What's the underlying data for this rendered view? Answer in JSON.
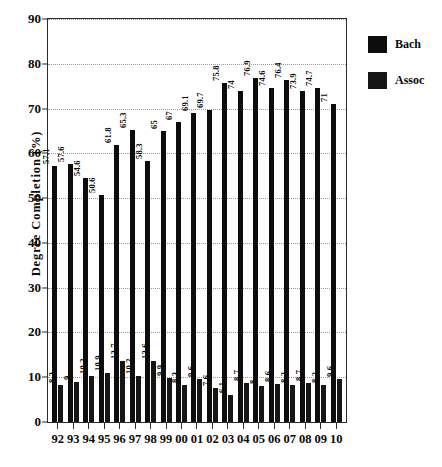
{
  "chart_data": {
    "type": "bar",
    "title": "",
    "xlabel": "",
    "ylabel": "Degree Completion (%)",
    "ylim": [
      0,
      90
    ],
    "yticks": [
      0,
      10,
      20,
      30,
      40,
      50,
      60,
      70,
      80,
      90
    ],
    "grid": true,
    "legend_position": "right",
    "categories": [
      "92",
      "93",
      "94",
      "95",
      "96",
      "97",
      "98",
      "99",
      "00",
      "01",
      "02",
      "03",
      "04",
      "05",
      "06",
      "07",
      "08",
      "09",
      "10"
    ],
    "series": [
      {
        "name": "Bach",
        "color": "#0d0d0d",
        "values": [
          57.1,
          57.6,
          54.6,
          50.6,
          61.8,
          65.3,
          58.3,
          65,
          67,
          69.1,
          69.7,
          75.8,
          74,
          76.9,
          74.6,
          76.4,
          73.9,
          74.7,
          71
        ],
        "labels": [
          "57.1",
          "57.6",
          "54.6",
          "50.6",
          "61.8",
          "65.3",
          "58.3",
          "65",
          "67",
          "69.1",
          "69.7",
          "75.8",
          "74",
          "76.9",
          "74.6",
          "76.4",
          "73.9",
          "74.7",
          "71"
        ]
      },
      {
        "name": "Assoc",
        "color": "#161616",
        "values": [
          8.3,
          9,
          10.2,
          10.9,
          13.7,
          10.2,
          13.6,
          9.9,
          8.3,
          9.6,
          7.6,
          6.1,
          8.7,
          8,
          8.6,
          8.2,
          8.7,
          8.2,
          9.6
        ],
        "labels": [
          "8.3",
          "9",
          "10.2",
          "10.9",
          "13.7",
          "10.2",
          "13.6",
          "9.9",
          "8.3",
          "9.6",
          "7.6",
          "6.1",
          "8.7",
          "8",
          "8.6",
          "8.2",
          "8.7",
          "8.2",
          "9.6"
        ]
      }
    ]
  },
  "legend": {
    "items": [
      {
        "label": "Bach"
      },
      {
        "label": "Assoc"
      }
    ]
  }
}
